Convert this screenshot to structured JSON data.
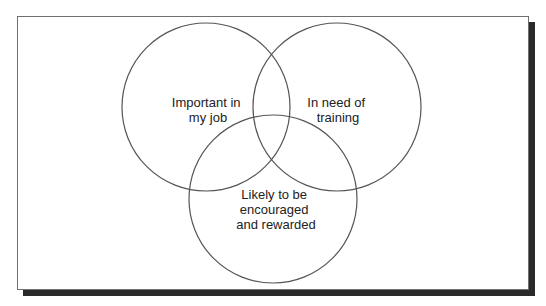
{
  "diagram": {
    "type": "venn",
    "sets": [
      {
        "id": "important",
        "lines": [
          "Important in",
          "my job"
        ],
        "cx": 206,
        "cy": 107,
        "r": 84
      },
      {
        "id": "training",
        "lines": [
          "In need of",
          "training"
        ],
        "cx": 337,
        "cy": 107,
        "r": 84
      },
      {
        "id": "rewarded",
        "lines": [
          "Likely to be",
          "encouraged",
          "and rewarded"
        ],
        "cx": 273,
        "cy": 199,
        "r": 84
      }
    ],
    "stroke_color": "#555555",
    "frame_shadow_color": "#2a2a2a"
  }
}
